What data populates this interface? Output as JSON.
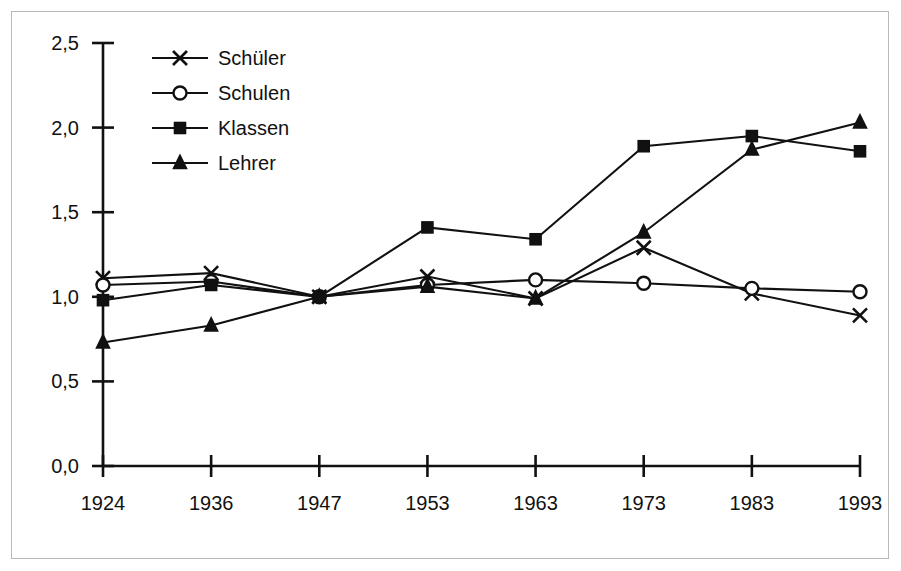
{
  "chart_data": {
    "type": "line",
    "title": "",
    "subtitle": "",
    "xlabel": "",
    "ylabel": "",
    "categories": [
      "1924",
      "1936",
      "1947",
      "1953",
      "1963",
      "1973",
      "1983",
      "1993"
    ],
    "ylim": [
      0.0,
      2.5
    ],
    "ytick_values": [
      0.0,
      0.5,
      1.0,
      1.5,
      2.0,
      2.5
    ],
    "ytick_labels": [
      "0,0",
      "0,5",
      "1,0",
      "1,5",
      "2,0",
      "2,5"
    ],
    "grid": false,
    "legend_position": "top-left-inside",
    "decimal_separator": ",",
    "baseline_year": "1947",
    "baseline_value": 1.0,
    "series": [
      {
        "name": "Schüler",
        "marker": "x-cross",
        "marker_style": "open-cross",
        "color": "#111111",
        "values": [
          1.11,
          1.14,
          1.0,
          1.12,
          0.99,
          1.29,
          1.02,
          0.89
        ]
      },
      {
        "name": "Schulen",
        "marker": "circle",
        "marker_style": "open-circle",
        "color": "#111111",
        "values": [
          1.07,
          1.09,
          1.0,
          1.07,
          1.1,
          1.08,
          1.05,
          1.03
        ]
      },
      {
        "name": "Klassen",
        "marker": "square",
        "marker_style": "filled-square",
        "color": "#111111",
        "values": [
          0.98,
          1.07,
          1.0,
          1.41,
          1.34,
          1.89,
          1.95,
          1.86
        ]
      },
      {
        "name": "Lehrer",
        "marker": "triangle",
        "marker_style": "filled-triangle",
        "color": "#111111",
        "values": [
          0.73,
          0.83,
          1.0,
          1.06,
          0.99,
          1.38,
          1.87,
          2.03
        ]
      }
    ]
  },
  "legend": {
    "entries": [
      {
        "label": "Schüler"
      },
      {
        "label": "Schulen"
      },
      {
        "label": "Klassen"
      },
      {
        "label": "Lehrer"
      }
    ]
  },
  "colors": {
    "ink": "#111111",
    "frame": "#b9b9b9",
    "background": "#ffffff"
  }
}
